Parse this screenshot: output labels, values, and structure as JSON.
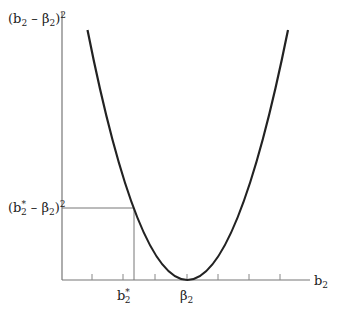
{
  "diagram": {
    "y_axis_label": {
      "open": "(b",
      "sub1": "2",
      "mid": " – β",
      "sub2": "2",
      "close": ")",
      "sup": "2"
    },
    "level_label": {
      "open": "(b",
      "star": "*",
      "sub1": "2",
      "mid": " – β",
      "sub2": "2",
      "close": ")",
      "sup": "2"
    },
    "x_axis_label": {
      "main": "b",
      "sub": "2"
    },
    "tick_label_bstar": {
      "main": "b",
      "star": "*",
      "sub": "2"
    },
    "tick_label_beta": {
      "main": "β",
      "sub": "2"
    },
    "colors": {
      "axis": "#777777",
      "curve": "#222222",
      "text": "#222222"
    }
  }
}
